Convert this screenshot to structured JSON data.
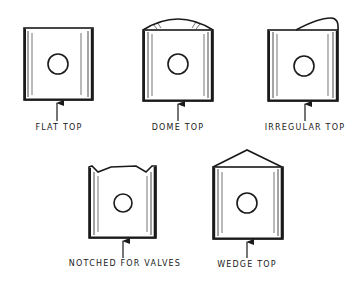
{
  "diagram": {
    "type": "piston head shapes",
    "ink_color": "#1a1a1a",
    "background": "#ffffff",
    "pistons": [
      {
        "id": "flat",
        "label": "FLAT TOP"
      },
      {
        "id": "dome",
        "label": "DOME TOP"
      },
      {
        "id": "irregular",
        "label": "IRREGULAR TOP"
      },
      {
        "id": "notched",
        "label": "NOTCHED FOR VALVES"
      },
      {
        "id": "wedge",
        "label": "WEDGE TOP"
      }
    ]
  }
}
